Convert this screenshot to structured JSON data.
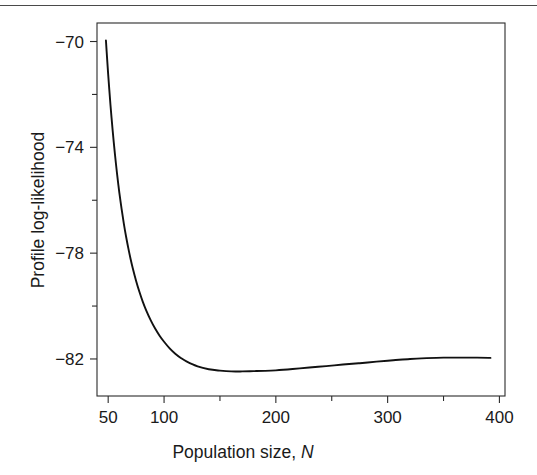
{
  "figure": {
    "background_color": "#ffffff",
    "ink_color": "#111111",
    "top_rule": true
  },
  "chart_data": {
    "type": "line",
    "title": "",
    "subtitle": "",
    "xlabel_text": "Population size,",
    "xlabel_symbol": "N",
    "xlabel": "Population size, N",
    "ylabel": "Profile log-likelihood",
    "xlim": [
      40,
      405
    ],
    "ylim": [
      -83.4,
      -69.3
    ],
    "grid": false,
    "legend": null,
    "legend_position": "none",
    "x_ticks": [
      50,
      100,
      150,
      200,
      250,
      300,
      350,
      400
    ],
    "x_tick_labels": [
      "50",
      "100",
      "",
      "200",
      "",
      "300",
      "",
      "400"
    ],
    "y_ticks": [
      -70,
      -72,
      -74,
      -76,
      -78,
      -80,
      -82
    ],
    "y_tick_labels": [
      "−70",
      "",
      "−74",
      "",
      "−78",
      "",
      "−82"
    ],
    "annotations": [],
    "series": [
      {
        "name": "Profile log-likelihood",
        "color": "#111111",
        "x": [
          48,
          49,
          50,
          51,
          52,
          53,
          54,
          55,
          56,
          57,
          58,
          59,
          60,
          62,
          64,
          66,
          68,
          70,
          72,
          75,
          78,
          81,
          84,
          88,
          92,
          96,
          100,
          105,
          110,
          115,
          120,
          130,
          140,
          150,
          160,
          170,
          180,
          190,
          200,
          215,
          230,
          245,
          260,
          275,
          290,
          305,
          320,
          335,
          350,
          365,
          380,
          392
        ],
        "y": [
          -69.96,
          -70.62,
          -71.24,
          -71.82,
          -72.37,
          -72.88,
          -73.36,
          -73.81,
          -74.24,
          -74.64,
          -75.02,
          -75.38,
          -75.72,
          -76.33,
          -76.88,
          -77.37,
          -77.81,
          -78.21,
          -78.57,
          -79.05,
          -79.47,
          -79.84,
          -80.16,
          -80.53,
          -80.85,
          -81.12,
          -81.35,
          -81.6,
          -81.8,
          -81.96,
          -82.09,
          -82.28,
          -82.39,
          -82.44,
          -82.47,
          -82.47,
          -82.46,
          -82.45,
          -82.43,
          -82.38,
          -82.32,
          -82.27,
          -82.21,
          -82.16,
          -82.1,
          -82.05,
          -82.0,
          -81.97,
          -81.95,
          -81.95,
          -81.95,
          -81.96
        ],
        "minimum_x": 160,
        "minimum_y": -82.47
      }
    ],
    "plot_area_px": {
      "left": 97,
      "right": 505,
      "top": 23,
      "bottom": 396
    }
  }
}
